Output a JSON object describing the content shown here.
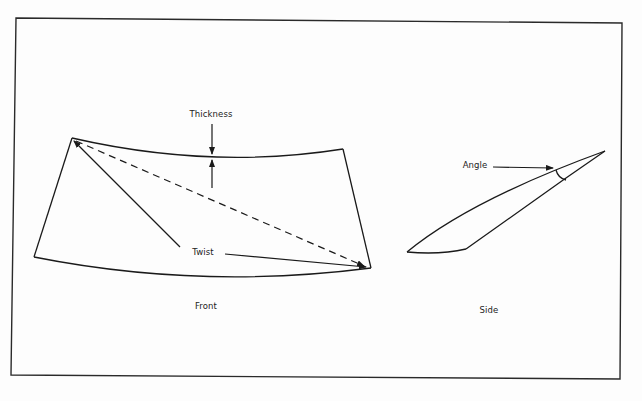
{
  "figure": {
    "views": [
      {
        "id": "front",
        "label": "Front"
      },
      {
        "id": "side",
        "label": "Side"
      }
    ],
    "annotations": {
      "thickness": "Thickness",
      "twist": "Twist",
      "angle": "Angle"
    },
    "colors": {
      "line": "#1a1a1a",
      "background": "#fdfdfd"
    }
  }
}
